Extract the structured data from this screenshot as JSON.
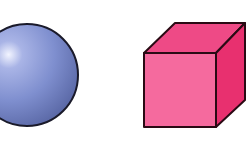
{
  "scene": {
    "background": "#ffffff",
    "shapes": [
      {
        "name": "sphere",
        "color": "#7f8fcf",
        "highlight": "#e6ebff",
        "shadow": "#5c6aa8",
        "outline": "#1a1a2a"
      },
      {
        "name": "cube",
        "front_color": "#f56a9e",
        "top_color": "#ee4a86",
        "side_color": "#e8306f",
        "outline": "#2a0a14"
      }
    ]
  }
}
